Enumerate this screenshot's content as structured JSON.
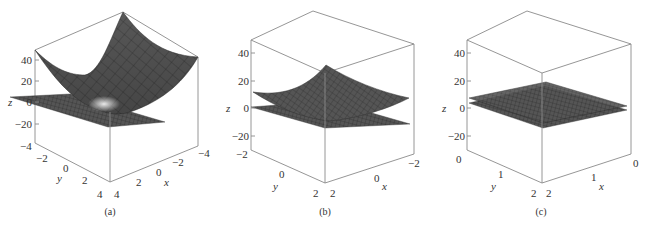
{
  "figure": {
    "panels": [
      {
        "id": "a",
        "caption": "(a)",
        "z_label": "z",
        "x_label": "x",
        "y_label": "y",
        "z_ticks": [
          "40",
          "20",
          "0",
          "−20"
        ],
        "x_ticks": [
          "4",
          "2",
          "0",
          "−2",
          "−4"
        ],
        "y_ticks": [
          "−4",
          "−2",
          "0",
          "2",
          "4"
        ],
        "x_range": [
          -4,
          4
        ],
        "y_range": [
          -4,
          4
        ],
        "z_range": [
          -30,
          50
        ]
      },
      {
        "id": "b",
        "caption": "(b)",
        "z_label": "z",
        "x_label": "x",
        "y_label": "y",
        "z_ticks": [
          "40",
          "20",
          "0",
          "−20"
        ],
        "x_ticks": [
          "2",
          "0",
          "−2"
        ],
        "y_ticks": [
          "−2",
          "0",
          "2"
        ],
        "x_range": [
          -2,
          2
        ],
        "y_range": [
          -2,
          2
        ],
        "z_range": [
          -30,
          50
        ]
      },
      {
        "id": "c",
        "caption": "(c)",
        "z_label": "z",
        "x_label": "x",
        "y_label": "y",
        "z_ticks": [
          "40",
          "20",
          "0",
          "−20"
        ],
        "x_ticks": [
          "2",
          "1",
          "0"
        ],
        "y_ticks": [
          "0",
          "1",
          "2"
        ],
        "x_range": [
          0,
          2
        ],
        "y_range": [
          0,
          2
        ],
        "z_range": [
          -30,
          50
        ]
      }
    ],
    "colors": {
      "surface": "#5a5a5a",
      "surface_light": "#d8d8d8",
      "plane": "#4a4a4a",
      "box": "#8a8a8a",
      "text": "#333333"
    }
  }
}
